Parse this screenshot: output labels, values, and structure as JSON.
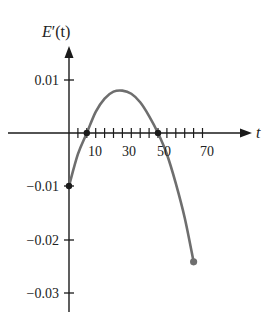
{
  "chart_data": {
    "type": "line",
    "title": "",
    "xlabel": "t",
    "ylabel": "E'(t)",
    "xlim": [
      0,
      75
    ],
    "ylim": [
      -0.032,
      0.014
    ],
    "x_ticks": [
      10,
      30,
      50,
      70
    ],
    "x_tick_labels": [
      "10",
      "30",
      "50",
      "70"
    ],
    "x_minor_tick_step": 5,
    "y_ticks": [
      0.01,
      -0.01,
      -0.02,
      -0.03
    ],
    "y_tick_labels": [
      "0.01",
      "−0.01",
      "−0.02",
      "−0.03"
    ],
    "grid": false,
    "series": [
      {
        "name": "E'(t)",
        "color": "#6e6e6e",
        "x": [
          0,
          5,
          10,
          15,
          20,
          25,
          30,
          35,
          40,
          45,
          50,
          55,
          60,
          65,
          70
        ],
        "y": [
          -0.01,
          -0.004,
          0.0,
          0.004,
          0.0065,
          0.0078,
          0.008,
          0.0074,
          0.0058,
          0.0032,
          0.0,
          -0.004,
          -0.0095,
          -0.016,
          -0.0243
        ]
      }
    ],
    "points": [
      {
        "x": 0,
        "y": -0.01,
        "marker": "dot"
      },
      {
        "x": 10,
        "y": 0,
        "marker": "dot"
      },
      {
        "x": 50,
        "y": 0,
        "marker": "dot"
      },
      {
        "x": 70,
        "y": -0.0243,
        "marker": "dot"
      }
    ]
  },
  "labels": {
    "ylabel_main": "E",
    "ylabel_prime": "′",
    "ylabel_arg": "(t)",
    "xlabel": "t",
    "x10": "10",
    "x30": "30",
    "x50": "50",
    "x70": "70",
    "y001": "0.01",
    "ym001": "−0.01",
    "ym002": "−0.02",
    "ym003": "−0.03"
  }
}
